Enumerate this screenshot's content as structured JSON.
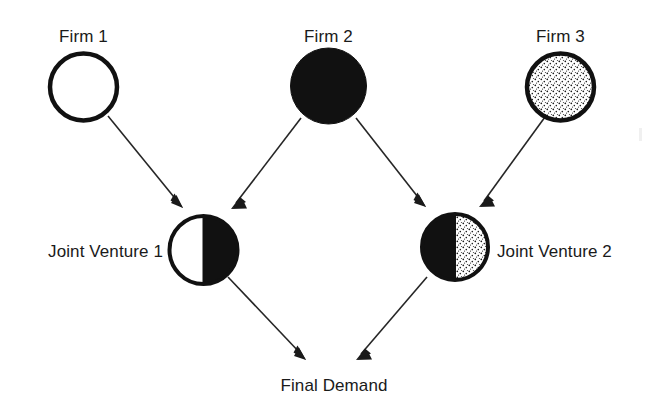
{
  "diagram": {
    "background_color": "#ffffff",
    "ink_color": "#1a1a1a",
    "nodes": [
      {
        "id": "firm1",
        "label": "Firm 1",
        "shape": "circle",
        "fill_style": "empty-white",
        "cx": 83.5,
        "cy": 87,
        "r": 36,
        "label_x": 83.5,
        "label_y": 42,
        "label_anchor": "middle"
      },
      {
        "id": "firm2",
        "label": "Firm 2",
        "shape": "circle",
        "fill_style": "solid-black",
        "cx": 328.5,
        "cy": 86,
        "r": 39,
        "label_x": 328.5,
        "label_y": 42,
        "label_anchor": "middle"
      },
      {
        "id": "firm3",
        "label": "Firm 3",
        "shape": "circle",
        "fill_style": "stippled",
        "cx": 560.5,
        "cy": 87,
        "r": 36,
        "label_x": 560.5,
        "label_y": 42,
        "label_anchor": "middle"
      },
      {
        "id": "jv1",
        "label": "Joint Venture 1",
        "shape": "circle",
        "fill_style": "half-white-left-black-right",
        "cx": 203.5,
        "cy": 250,
        "r": 36,
        "label_x": 163,
        "label_y": 257,
        "label_anchor": "end"
      },
      {
        "id": "jv2",
        "label": "Joint Venture 2",
        "shape": "circle",
        "fill_style": "half-black-left-stippled-right",
        "cx": 455,
        "cy": 247,
        "r": 35,
        "label_x": 497,
        "label_y": 257,
        "label_anchor": "start"
      },
      {
        "id": "final-demand",
        "label": "Final Demand",
        "shape": "text-only",
        "fill_style": "none",
        "cx": 334,
        "cy": 385,
        "r": 0,
        "label_x": 334,
        "label_y": 391,
        "label_anchor": "middle"
      }
    ],
    "edges": [
      {
        "id": "firm1-to-jv1",
        "from": "Firm 1",
        "to": "Joint Venture 1",
        "x1": 108,
        "y1": 116,
        "x2": 183,
        "y2": 208
      },
      {
        "id": "firm2-to-jv1",
        "from": "Firm 2",
        "to": "Joint Venture 1",
        "x1": 301,
        "y1": 118,
        "x2": 231,
        "y2": 209
      },
      {
        "id": "firm2-to-jv2",
        "from": "Firm 2",
        "to": "Joint Venture 2",
        "x1": 356,
        "y1": 118,
        "x2": 426,
        "y2": 207
      },
      {
        "id": "firm3-to-jv2",
        "from": "Firm 3",
        "to": "Joint Venture 2",
        "x1": 545,
        "y1": 117,
        "x2": 479,
        "y2": 207
      },
      {
        "id": "jv1-to-final-demand",
        "from": "Joint Venture 1",
        "to": "Final Demand",
        "x1": 228,
        "y1": 277,
        "x2": 306,
        "y2": 360
      },
      {
        "id": "jv2-to-final-demand",
        "from": "Joint Venture 2",
        "to": "Final Demand",
        "x1": 427,
        "y1": 277,
        "x2": 356,
        "y2": 360
      }
    ],
    "legend_note": ""
  }
}
